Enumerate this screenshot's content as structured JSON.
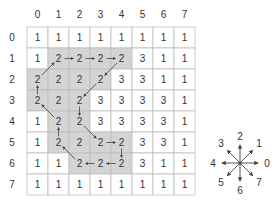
{
  "grid": {
    "col_labels": [
      "0",
      "1",
      "2",
      "3",
      "4",
      "5",
      "6",
      "7"
    ],
    "row_labels": [
      "0",
      "1",
      "2",
      "3",
      "4",
      "5",
      "6",
      "7"
    ],
    "values": [
      [
        1,
        1,
        1,
        1,
        1,
        1,
        1,
        1
      ],
      [
        1,
        2,
        2,
        2,
        2,
        3,
        1,
        1
      ],
      [
        2,
        2,
        2,
        2,
        3,
        3,
        1,
        1
      ],
      [
        2,
        2,
        2,
        3,
        3,
        3,
        3,
        1
      ],
      [
        1,
        2,
        2,
        3,
        3,
        3,
        3,
        1
      ],
      [
        1,
        2,
        2,
        2,
        2,
        3,
        3,
        1
      ],
      [
        1,
        1,
        2,
        2,
        2,
        3,
        1,
        1
      ],
      [
        1,
        1,
        1,
        1,
        1,
        1,
        1,
        1
      ]
    ],
    "shaded": [
      [
        1,
        1
      ],
      [
        1,
        2
      ],
      [
        1,
        3
      ],
      [
        1,
        4
      ],
      [
        2,
        0
      ],
      [
        2,
        1
      ],
      [
        2,
        2
      ],
      [
        2,
        3
      ],
      [
        3,
        0
      ],
      [
        3,
        1
      ],
      [
        3,
        2
      ],
      [
        4,
        1
      ],
      [
        4,
        2
      ],
      [
        5,
        1
      ],
      [
        5,
        2
      ],
      [
        5,
        3
      ],
      [
        5,
        4
      ],
      [
        6,
        2
      ],
      [
        6,
        3
      ],
      [
        6,
        4
      ]
    ],
    "chain_path": [
      [
        2,
        0
      ],
      [
        1,
        1
      ],
      [
        1,
        2
      ],
      [
        1,
        3
      ],
      [
        1,
        4
      ],
      [
        2,
        3
      ],
      [
        3,
        2
      ],
      [
        4,
        2
      ],
      [
        5,
        3
      ],
      [
        5,
        4
      ],
      [
        6,
        4
      ],
      [
        6,
        3
      ],
      [
        6,
        2
      ],
      [
        5,
        1
      ],
      [
        4,
        1
      ],
      [
        3,
        0
      ],
      [
        2,
        0
      ]
    ]
  },
  "compass": {
    "labels": [
      "0",
      "1",
      "2",
      "3",
      "4",
      "5",
      "6",
      "7"
    ]
  },
  "colors": {
    "shade": "#d4d4d4",
    "grid_line": "#bdbdbd",
    "arrow": "#444444",
    "text": "#333333"
  }
}
